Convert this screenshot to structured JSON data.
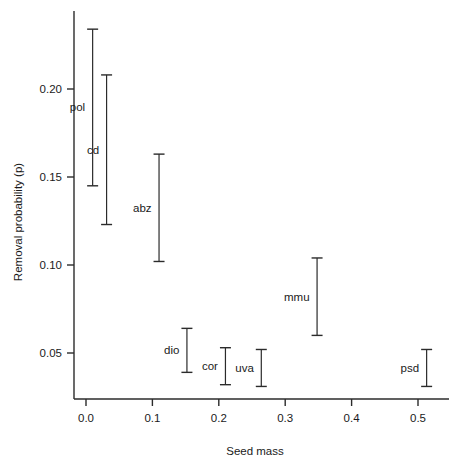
{
  "chart_data": {
    "type": "scatter",
    "title": "",
    "xlabel": "Seed mass",
    "ylabel": "Removal probability (p)",
    "xlim": [
      -0.022,
      0.555
    ],
    "ylim": [
      0.021,
      0.245
    ],
    "xticks": [
      0.0,
      0.1,
      0.2,
      0.3,
      0.4,
      0.5
    ],
    "xticklabels": [
      "0.0",
      "0.1",
      "0.2",
      "0.3",
      "0.4",
      "0.5"
    ],
    "yticks": [
      0.05,
      0.1,
      0.15,
      0.2
    ],
    "yticklabels": [
      "0.05",
      "0.10",
      "0.15",
      "0.20"
    ],
    "grid": false,
    "legend": false,
    "error_bar_style": "vertical-interval-with-caps",
    "points": [
      {
        "label": "pol",
        "x": 0.01,
        "low": 0.145,
        "high": 0.234,
        "label_side": "left"
      },
      {
        "label": "cd",
        "x": 0.031,
        "low": 0.123,
        "high": 0.208,
        "label_side": "left"
      },
      {
        "label": "abz",
        "x": 0.11,
        "low": 0.102,
        "high": 0.163,
        "label_side": "left"
      },
      {
        "label": "dio",
        "x": 0.152,
        "low": 0.039,
        "high": 0.064,
        "label_side": "left"
      },
      {
        "label": "cor",
        "x": 0.21,
        "low": 0.032,
        "high": 0.053,
        "label_side": "left"
      },
      {
        "label": "uva",
        "x": 0.264,
        "low": 0.031,
        "high": 0.052,
        "label_side": "left"
      },
      {
        "label": "mmu",
        "x": 0.348,
        "low": 0.06,
        "high": 0.104,
        "label_side": "left"
      },
      {
        "label": "psd",
        "x": 0.513,
        "low": 0.031,
        "high": 0.052,
        "label_side": "left"
      }
    ],
    "colors": {
      "axis": "#2b2b2b",
      "marker": "#2b2b2b",
      "background": "#ffffff"
    }
  }
}
